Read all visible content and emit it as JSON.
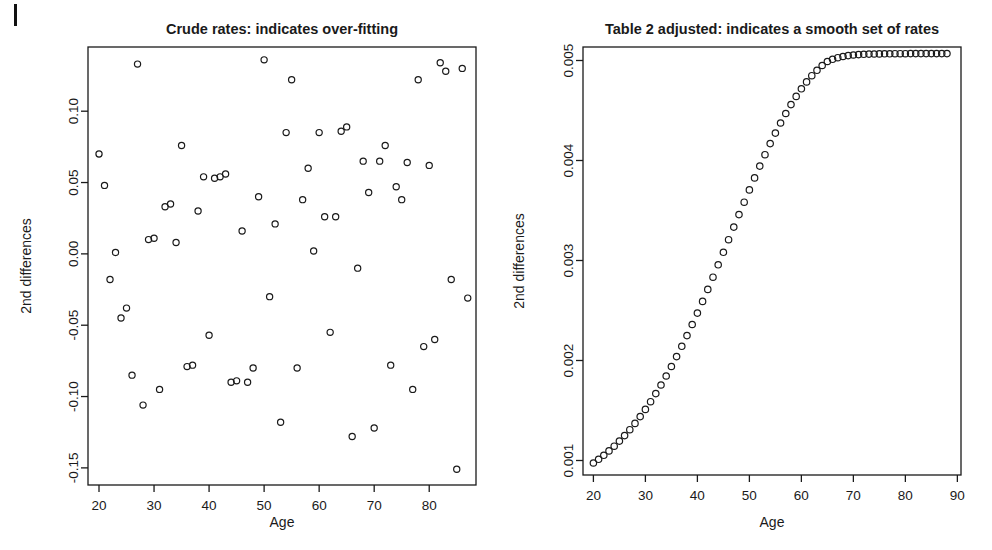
{
  "figure": {
    "width": 992,
    "height": 550,
    "background": "#ffffff",
    "ink_color": "#1a1a1a",
    "scan_artifact": "vertical-tick-mark-top-left"
  },
  "chart_data": [
    {
      "type": "scatter",
      "id": "crude-rates",
      "title": "Crude rates: indicates over-fitting",
      "xlabel": "Age",
      "ylabel": "2nd differences",
      "xlim": [
        18.0,
        88.5
      ],
      "ylim": [
        -0.162,
        0.145
      ],
      "xticks": [
        20,
        30,
        40,
        50,
        60,
        70,
        80,
        90
      ],
      "xtick_labels": [
        "20",
        "30",
        "40",
        "50",
        "60",
        "70",
        "80",
        "90"
      ],
      "yticks": [
        0.1,
        0.05,
        0.0,
        -0.05,
        -0.1,
        -0.15
      ],
      "ytick_labels": [
        "0.10",
        "0.05",
        "0.00",
        "-0.05",
        "-0.10",
        "-0.15"
      ],
      "grid": false,
      "legend": null,
      "marker": "open-circle",
      "marker_size": 3.1,
      "x": [
        20,
        21,
        22,
        23,
        24,
        25,
        26,
        27,
        28,
        29,
        30,
        31,
        32,
        33,
        34,
        35,
        36,
        37,
        38,
        39,
        40,
        41,
        42,
        43,
        44,
        45,
        46,
        47,
        48,
        49,
        50,
        51,
        52,
        53,
        54,
        55,
        56,
        57,
        58,
        59,
        60,
        61,
        62,
        63,
        64,
        65,
        66,
        67,
        68,
        69,
        70,
        71,
        72,
        73,
        74,
        75,
        76,
        77,
        78,
        79,
        80,
        81,
        82,
        83,
        84,
        85,
        86,
        87
      ],
      "y": [
        0.07,
        0.048,
        -0.018,
        0.001,
        -0.045,
        -0.038,
        -0.085,
        0.133,
        -0.106,
        0.01,
        0.011,
        -0.095,
        0.033,
        0.035,
        0.008,
        0.076,
        -0.079,
        -0.078,
        0.03,
        0.054,
        -0.057,
        0.053,
        0.054,
        0.056,
        -0.09,
        -0.089,
        0.016,
        -0.09,
        -0.08,
        0.04,
        0.136,
        -0.03,
        0.021,
        -0.118,
        0.085,
        0.122,
        -0.08,
        0.038,
        0.06,
        0.002,
        0.085,
        0.026,
        -0.055,
        0.026,
        0.086,
        0.089,
        -0.128,
        -0.01,
        0.065,
        0.043,
        -0.122,
        0.065,
        0.076,
        -0.078,
        0.047,
        0.038,
        0.064,
        -0.095,
        0.122,
        -0.065,
        0.062,
        -0.06,
        0.134,
        0.128,
        -0.018,
        -0.151,
        0.13,
        -0.031
      ]
    },
    {
      "type": "scatter",
      "id": "table-2-adjusted",
      "title": "Table 2 adjusted: indicates a smooth set of rates",
      "xlabel": "Age",
      "ylabel": "2nd differences",
      "xlim": [
        18.0,
        90.7
      ],
      "ylim": [
        0.000855,
        0.005135
      ],
      "xticks": [
        20,
        30,
        40,
        50,
        60,
        70,
        80,
        90
      ],
      "xtick_labels": [
        "20",
        "30",
        "40",
        "50",
        "60",
        "70",
        "80",
        "90"
      ],
      "yticks": [
        0.005,
        0.004,
        0.003,
        0.002,
        0.001
      ],
      "ytick_labels": [
        "0.005",
        "0.004",
        "0.003",
        "0.002",
        "0.001"
      ],
      "grid": false,
      "legend": null,
      "marker": "open-circle",
      "marker_size": 3.2,
      "x": [
        20,
        21,
        22,
        23,
        24,
        25,
        26,
        27,
        28,
        29,
        30,
        31,
        32,
        33,
        34,
        35,
        36,
        37,
        38,
        39,
        40,
        41,
        42,
        43,
        44,
        45,
        46,
        47,
        48,
        49,
        50,
        51,
        52,
        53,
        54,
        55,
        56,
        57,
        58,
        59,
        60,
        61,
        62,
        63,
        64,
        65,
        66,
        67,
        68,
        69,
        70,
        71,
        72,
        73,
        74,
        75,
        76,
        77,
        78,
        79,
        80,
        81,
        82,
        83,
        84,
        85,
        86,
        87,
        88
      ],
      "y": [
        0.000975,
        0.001012,
        0.001052,
        0.001096,
        0.001143,
        0.001194,
        0.001249,
        0.001308,
        0.001371,
        0.001439,
        0.001511,
        0.001588,
        0.001669,
        0.001755,
        0.001845,
        0.00194,
        0.002039,
        0.002142,
        0.002249,
        0.00236,
        0.002474,
        0.002591,
        0.002711,
        0.002833,
        0.002957,
        0.003082,
        0.003208,
        0.003334,
        0.003459,
        0.003583,
        0.003706,
        0.003826,
        0.003944,
        0.004058,
        0.004169,
        0.004274,
        0.004375,
        0.00447,
        0.004559,
        0.004641,
        0.004717,
        0.004786,
        0.004848,
        0.004902,
        0.00495,
        0.00499,
        0.005012,
        0.005028,
        0.00504,
        0.005049,
        0.005055,
        0.005059,
        0.005062,
        0.005064,
        0.005065,
        0.005066,
        0.005067,
        0.005067,
        0.005068,
        0.005068,
        0.005068,
        0.005069,
        0.005069,
        0.005069,
        0.005069,
        0.005069,
        0.005069,
        0.005069,
        0.005069
      ]
    }
  ]
}
